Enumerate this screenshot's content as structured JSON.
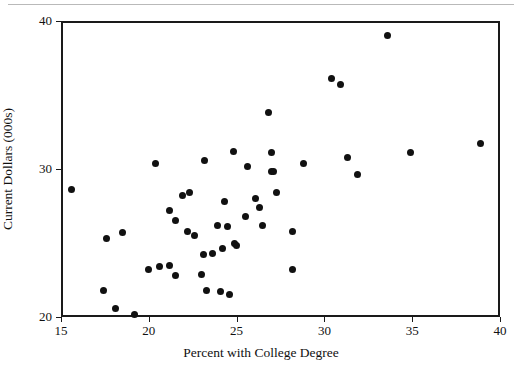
{
  "chart_data": {
    "type": "scatter",
    "title": "",
    "xlabel": "Percent with College Degree",
    "ylabel": "Current Dollars (000s)",
    "xlim": [
      15,
      40
    ],
    "ylim": [
      20,
      40
    ],
    "xticks": [
      15,
      20,
      25,
      30,
      35,
      40
    ],
    "yticks": [
      20,
      30,
      40
    ],
    "xtick_labels": [
      "15",
      "20",
      "25",
      "30",
      "35",
      "40"
    ],
    "ytick_labels": [
      "20",
      "30",
      "40"
    ],
    "grid": false,
    "legend": null,
    "marker": "filled-circle",
    "marker_color": "#111111",
    "points": [
      {
        "x": 15.6,
        "y": 28.6
      },
      {
        "x": 17.4,
        "y": 21.8
      },
      {
        "x": 17.6,
        "y": 25.3
      },
      {
        "x": 18.1,
        "y": 20.6
      },
      {
        "x": 18.5,
        "y": 25.7
      },
      {
        "x": 19.2,
        "y": 20.2
      },
      {
        "x": 20.0,
        "y": 23.2
      },
      {
        "x": 20.4,
        "y": 30.4
      },
      {
        "x": 20.6,
        "y": 23.4
      },
      {
        "x": 21.2,
        "y": 27.2
      },
      {
        "x": 21.2,
        "y": 23.5
      },
      {
        "x": 21.5,
        "y": 22.8
      },
      {
        "x": 21.5,
        "y": 26.5
      },
      {
        "x": 21.9,
        "y": 28.2
      },
      {
        "x": 22.2,
        "y": 25.8
      },
      {
        "x": 22.3,
        "y": 28.4
      },
      {
        "x": 22.6,
        "y": 25.5
      },
      {
        "x": 23.0,
        "y": 22.9
      },
      {
        "x": 23.1,
        "y": 24.2
      },
      {
        "x": 23.2,
        "y": 30.6
      },
      {
        "x": 23.3,
        "y": 21.8
      },
      {
        "x": 23.6,
        "y": 24.3
      },
      {
        "x": 23.9,
        "y": 26.2
      },
      {
        "x": 24.1,
        "y": 21.7
      },
      {
        "x": 24.2,
        "y": 24.6
      },
      {
        "x": 24.3,
        "y": 27.8
      },
      {
        "x": 24.5,
        "y": 26.1
      },
      {
        "x": 24.6,
        "y": 21.5
      },
      {
        "x": 24.8,
        "y": 31.2
      },
      {
        "x": 24.9,
        "y": 25.0
      },
      {
        "x": 25.0,
        "y": 24.8
      },
      {
        "x": 25.5,
        "y": 26.8
      },
      {
        "x": 25.6,
        "y": 30.2
      },
      {
        "x": 26.1,
        "y": 28.0
      },
      {
        "x": 26.3,
        "y": 27.4
      },
      {
        "x": 26.5,
        "y": 26.2
      },
      {
        "x": 26.8,
        "y": 33.8
      },
      {
        "x": 27.0,
        "y": 29.8
      },
      {
        "x": 27.0,
        "y": 31.1
      },
      {
        "x": 27.1,
        "y": 29.8
      },
      {
        "x": 27.3,
        "y": 28.4
      },
      {
        "x": 28.2,
        "y": 23.2
      },
      {
        "x": 28.2,
        "y": 25.8
      },
      {
        "x": 28.8,
        "y": 30.4
      },
      {
        "x": 30.4,
        "y": 36.1
      },
      {
        "x": 30.9,
        "y": 35.7
      },
      {
        "x": 31.3,
        "y": 30.8
      },
      {
        "x": 31.9,
        "y": 29.6
      },
      {
        "x": 33.6,
        "y": 39.0
      },
      {
        "x": 34.9,
        "y": 31.1
      },
      {
        "x": 38.9,
        "y": 31.7
      }
    ]
  }
}
